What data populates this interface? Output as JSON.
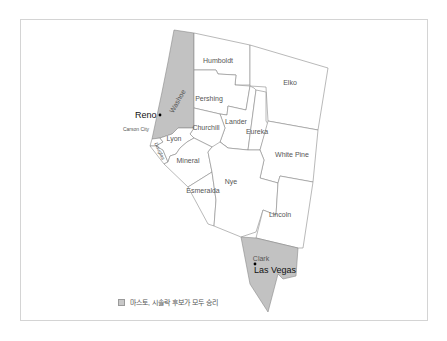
{
  "map": {
    "title": "Nevada counties",
    "highlight_color": "#c2c2c2",
    "counties": [
      {
        "name": "Humboldt",
        "highlighted": false
      },
      {
        "name": "Elko",
        "highlighted": false
      },
      {
        "name": "Washoe",
        "highlighted": true
      },
      {
        "name": "Pershing",
        "highlighted": false
      },
      {
        "name": "Lander",
        "highlighted": false
      },
      {
        "name": "Eureka",
        "highlighted": false
      },
      {
        "name": "Churchill",
        "highlighted": false
      },
      {
        "name": "Lyon",
        "highlighted": false
      },
      {
        "name": "Douglas",
        "highlighted": false
      },
      {
        "name": "Carson City",
        "highlighted": false
      },
      {
        "name": "White Pine",
        "highlighted": false
      },
      {
        "name": "Mineral",
        "highlighted": false
      },
      {
        "name": "Nye",
        "highlighted": false
      },
      {
        "name": "Esmeralda",
        "highlighted": false
      },
      {
        "name": "Lincoln",
        "highlighted": false
      },
      {
        "name": "Clark",
        "highlighted": true
      }
    ],
    "cities": [
      {
        "name": "Reno"
      },
      {
        "name": "Las Vegas"
      }
    ]
  },
  "labels": {
    "humboldt": "Humboldt",
    "elko": "Elko",
    "washoe": "Washoe",
    "pershing": "Pershing",
    "lander": "Lander",
    "eureka": "Eureka",
    "churchill": "Churchill",
    "lyon": "Lyon",
    "douglas": "Douglas",
    "carson_city": "Carson City",
    "white_pine": "White Pine",
    "mineral": "Mineral",
    "nye": "Nye",
    "esmeralda": "Esmeralda",
    "lincoln": "Lincoln",
    "clark": "Clark",
    "reno": "Reno",
    "las_vegas": "Las Vegas"
  },
  "legend": {
    "label": "마스토, 시솔락 후보가 모두 승리",
    "color": "#c8c8c8"
  }
}
